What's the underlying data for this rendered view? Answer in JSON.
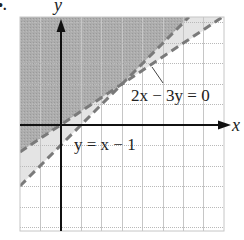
{
  "figure": {
    "marker": "•.",
    "axes": {
      "x_label": "x",
      "y_label": "y",
      "origin_px": [
        61,
        125
      ],
      "unit_px": 20.4,
      "x_range": [
        -2,
        8
      ],
      "y_range": [
        -5.2,
        5.3
      ]
    },
    "lines": [
      {
        "equation": "2x − 3y = 0",
        "style": "dashed",
        "slope": 0.6667,
        "intercept": 0
      },
      {
        "equation": "y = x − 1",
        "style": "dashed",
        "slope": 1,
        "intercept": -1
      }
    ],
    "labels": {
      "line1": "2x − 3y = 0",
      "line2": "y = x − 1"
    },
    "regions": [
      {
        "name": "above-both-lines",
        "fill": "#a9a9a9"
      },
      {
        "name": "between-lines",
        "fill": "#e4e4e4"
      }
    ],
    "colors": {
      "grid": "#c6c6c6",
      "axis": "#111111",
      "dash": "#7a7a7a"
    }
  }
}
